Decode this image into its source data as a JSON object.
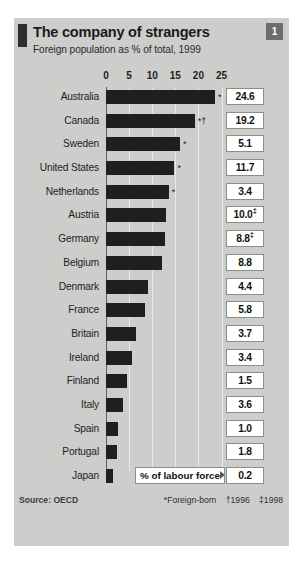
{
  "figure": {
    "number_badge": "1",
    "title": "The company of strangers",
    "subtitle": "Foreign population as % of total, 1999",
    "source": "Source: OECD",
    "note_foreign_born": "*Foreign-born",
    "note_1996": "†1996",
    "note_1998": "‡1998",
    "callout_label": "% of labour force"
  },
  "chart_data": {
    "type": "bar",
    "title": "The company of strangers",
    "subtitle": "Foreign population as % of total, 1999",
    "xlabel": "",
    "ylabel": "",
    "orientation": "horizontal",
    "xlim": [
      0,
      27
    ],
    "ticks": [
      0,
      5,
      10,
      15,
      20,
      25
    ],
    "tick_labels": [
      "0",
      "5",
      "10",
      "15",
      "20",
      "25"
    ],
    "grid": true,
    "legend": null,
    "bar_color": "#201f1f",
    "value_column_header": "% of labour force",
    "categories": [
      "Australia",
      "Canada",
      "Sweden",
      "United States",
      "Netherlands",
      "Austria",
      "Germany",
      "Belgium",
      "Denmark",
      "France",
      "Britain",
      "Ireland",
      "Finland",
      "Italy",
      "Spain",
      "Portugal",
      "Japan"
    ],
    "values": [
      23.6,
      19.2,
      16.0,
      14.8,
      13.6,
      13.0,
      12.8,
      12.2,
      9.0,
      8.4,
      6.4,
      5.6,
      4.6,
      3.6,
      2.6,
      2.4,
      1.6
    ],
    "marks": [
      "*",
      "*†",
      "*",
      "*",
      "*",
      "",
      "",
      "",
      "",
      "",
      "",
      "",
      "",
      "",
      "",
      "",
      ""
    ],
    "labour_force_values": [
      "24.6",
      "19.2",
      "5.1",
      "11.7",
      "3.4",
      "10.0",
      "8.8",
      "8.8",
      "4.4",
      "5.8",
      "3.7",
      "3.4",
      "1.5",
      "3.6",
      "1.0",
      "1.8",
      "0.2"
    ],
    "labour_force_marks": [
      "",
      "",
      "",
      "",
      "",
      "‡",
      "‡",
      "",
      "",
      "",
      "",
      "",
      "",
      "",
      "",
      "",
      ""
    ],
    "annotations": [
      "*Foreign-born",
      "†1996",
      "‡1998",
      "Source: OECD"
    ]
  }
}
